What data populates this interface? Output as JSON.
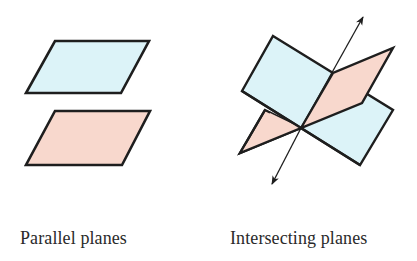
{
  "colors": {
    "blue_plane": "#dcf3f8",
    "pink_plane": "#f8d8cd",
    "outline": "#1e1e1e"
  },
  "figures": [
    {
      "id": "parallel",
      "caption": "Parallel planes",
      "planes": [
        {
          "color": "blue",
          "points": [
            [
              55,
              41
            ],
            [
              149,
              41
            ],
            [
              121,
              93
            ],
            [
              26,
              93
            ]
          ]
        },
        {
          "color": "pink",
          "points": [
            [
              55,
              111
            ],
            [
              150,
              111
            ],
            [
              122,
              165
            ],
            [
              26,
              165
            ]
          ]
        }
      ]
    },
    {
      "id": "intersecting",
      "caption": "Intersecting planes",
      "planes": [
        {
          "color": "blue",
          "points": [
            [
              273,
              36
            ],
            [
              393,
              110
            ],
            [
              360,
              165
            ],
            [
              242,
              91
            ]
          ]
        },
        {
          "color": "pink",
          "points": [
            [
              240,
              153
            ],
            [
              265,
              110
            ],
            [
              301,
              128
            ],
            [
              333,
              73
            ],
            [
              393,
              48
            ],
            [
              362,
              103
            ]
          ]
        }
      ],
      "line_of_intersection": {
        "from": [
          272,
          184
        ],
        "to": [
          363,
          17
        ],
        "arrows": "both"
      }
    }
  ]
}
